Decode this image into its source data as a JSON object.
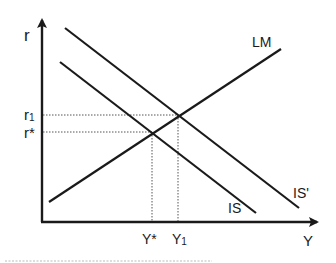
{
  "diagram": {
    "type": "IS-LM model",
    "axes": {
      "y_axis_label": "r",
      "x_axis_label": "Y"
    },
    "curves": {
      "lm": {
        "label": "LM"
      },
      "is": {
        "label": "IS"
      },
      "is_shifted": {
        "label": "IS'"
      }
    },
    "equilibria": {
      "initial": {
        "r_label": "r*",
        "y_label": "Y*"
      },
      "new": {
        "r_label": "r",
        "r_sub": "1",
        "y_label": "Y",
        "y_sub": "1"
      }
    },
    "colors": {
      "line": "#1a1a1a",
      "guide": "#555555",
      "footer_rule": "#bbbbbb"
    }
  }
}
